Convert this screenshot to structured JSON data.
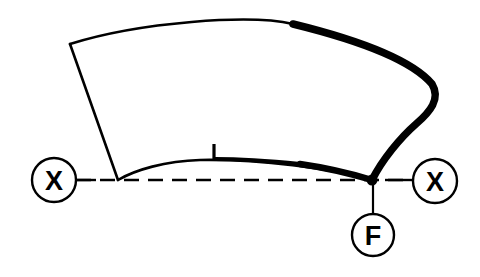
{
  "diagram": {
    "background_color": "#ffffff",
    "stroke_color": "#000000",
    "canvas": {
      "width": 480,
      "height": 277
    },
    "markers": [
      {
        "id": "marker-x-left",
        "label": "X",
        "name": "x-marker-left",
        "cx": 54,
        "cy": 180,
        "r": 22,
        "stroke_width": 2.4,
        "meaning": "backing plate reference datum left"
      },
      {
        "id": "marker-x-right",
        "label": "X",
        "name": "x-marker-right",
        "cx": 435,
        "cy": 181,
        "r": 22,
        "stroke_width": 2.4,
        "meaning": "backing plate reference datum right"
      },
      {
        "id": "marker-f",
        "label": "F",
        "name": "f-marker",
        "cx": 373,
        "cy": 235,
        "r": 21,
        "stroke_width": 2.4,
        "meaning": "friction material thickness callout"
      }
    ],
    "datum_line": {
      "name": "datum-dashed-line",
      "y": 180,
      "x_start": 76,
      "x_end": 413,
      "dash_pattern": "15 9",
      "stroke_width": 2.4,
      "solid_tail": {
        "x_start": 385,
        "x_end": 413
      },
      "solid_head": {
        "x_start": 76,
        "x_end": 96
      }
    },
    "leader_line": {
      "name": "f-leader-line",
      "x": 373,
      "y_start": 181,
      "y_end": 214,
      "stroke_width": 2.2
    },
    "pad_outline": {
      "name": "brake-pad-outline",
      "top_edge": "M 70 44 C 140 22, 250 14, 293 24 C 350 38, 410 58, 432 84",
      "right_edge": "M 432 84 C 441 99, 430 112, 416 124 C 400 138, 382 160, 372 180",
      "bottom_edge": "M 372 180 C 330 168, 260 159, 200 160 C 165 161, 135 170, 118 180",
      "left_edge": "M 118 180 L 70 44",
      "thin_stroke_width": 2.6,
      "thick_stroke_width": 7.5
    },
    "thick_segments": [
      {
        "name": "pad-top-right-thick-edge",
        "path": "M 293 24 C 350 38, 410 58, 432 84 C 441 99, 430 112, 416 124 C 400 138, 382 160, 372 180",
        "stroke_width": 7.5
      },
      {
        "name": "pad-bottom-right-thick-edge",
        "path": "M 372 180 C 352 174, 328 168, 300 164",
        "stroke_width": 6.5
      },
      {
        "name": "pad-bottom-taper-edge",
        "path": "M 300 164 C 270 161, 240 159, 215 159",
        "stroke_width": 4.2
      }
    ],
    "vertex_node": {
      "name": "pad-bottom-right-vertex",
      "cx": 372,
      "cy": 180,
      "r": 5.5
    },
    "tick_mark": {
      "name": "wear-indicator-tick",
      "x": 214,
      "y_top": 144,
      "y_bottom": 160,
      "stroke_width": 3.2,
      "meaning": "minimum thickness wear indicator notch"
    }
  }
}
